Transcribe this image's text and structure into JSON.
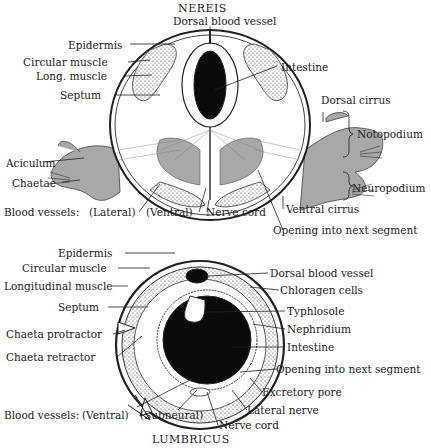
{
  "diagrams": [
    {
      "title": "NEREIS",
      "labels": {
        "dorsal_blood_vessel": "Dorsal blood vessel",
        "epidermis": "Epidermis",
        "circular_muscle": "Circular muscle",
        "long_muscle": "Long. muscle",
        "septum": "Septum",
        "intestine": "Intestine",
        "dorsal_cirrus": "Dorsal cirrus",
        "notopodium": "Notopodium",
        "aciculum": "Aciculum",
        "chaetae": "Chaetae",
        "neuropodium": "Neuropodium",
        "blood_vessels": "Blood vessels:",
        "lateral": "(Lateral)",
        "ventral": "(Ventral)",
        "nerve_cord": "Nerve cord",
        "ventral_cirrus": "Ventral cirrus",
        "opening": "Opening into next segment"
      }
    },
    {
      "title": "LUMBRICUS",
      "labels": {
        "epidermis": "Epidermis",
        "circular_muscle": "Circular muscle",
        "longitudinal_muscle": "Longitudinal muscle",
        "septum": "Septum",
        "chaeta_protractor": "Chaeta protractor",
        "chaeta_retractor": "Chaeta retractor",
        "dorsal_blood_vessel": "Dorsal blood vessel",
        "chloragen_cells": "Chloragen cells",
        "typhlosole": "Typhlosole",
        "nephridium": "Nephridium",
        "intestine": "Intestine",
        "opening": "Opening into next segment",
        "excretory_pore": "Excretory pore",
        "lateral_nerve": "Lateral nerve",
        "nerve_cord": "Nerve cord",
        "blood_vessels": "Blood vessels:",
        "ventral": "(Ventral)",
        "subneural": "(Subneural)"
      }
    }
  ],
  "colors": {
    "ink": "#1a1a1a",
    "parapodia_gray": "#a8a8a8",
    "lumen_black": "#0a0a0a",
    "background": "#ffffff"
  }
}
